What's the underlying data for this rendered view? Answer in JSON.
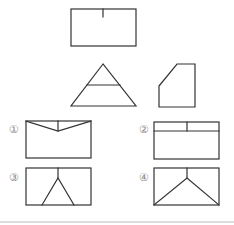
{
  "figure": {
    "views": {
      "top_rectangle": "front-view",
      "triangle": "plan-view",
      "pentagon": "side-view"
    },
    "options": [
      {
        "label": "①",
        "shape": "rectangle with V-notch lines at top"
      },
      {
        "label": "②",
        "shape": "rectangle with horizontal band and central divider"
      },
      {
        "label": "③",
        "shape": "rectangle with inverted-Y narrow triangle"
      },
      {
        "label": "④",
        "shape": "rectangle with inverted-Y wide triangle to corners"
      }
    ],
    "colors": {
      "line": "#333333",
      "label": "#888888",
      "divider": "#dddddd"
    }
  }
}
